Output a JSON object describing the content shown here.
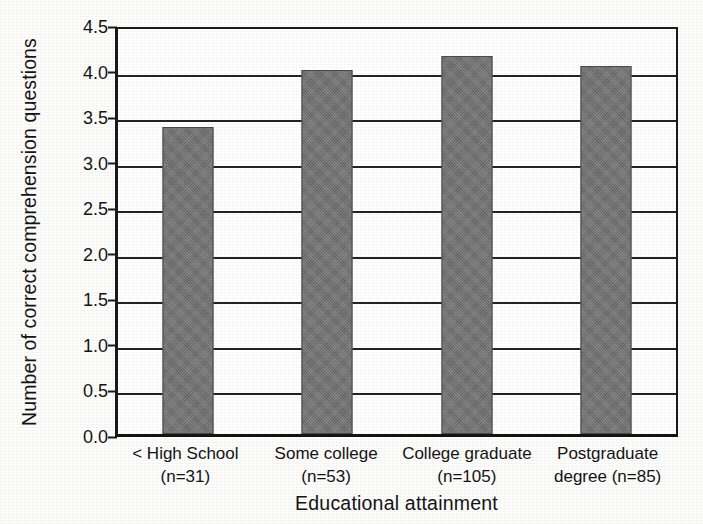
{
  "chart_data": {
    "type": "bar",
    "title": "",
    "xlabel": "Educational attainment",
    "ylabel": "Number of correct comprehension questions",
    "categories": [
      "< High School",
      "Some college",
      "College graduate",
      "Postgraduate degree"
    ],
    "category_labels": [
      {
        "line1": "< High School",
        "line2": "(n=31)"
      },
      {
        "line1": "Some college",
        "line2": "(n=53)"
      },
      {
        "line1": "College graduate",
        "line2": "(n=105)"
      },
      {
        "line1": "Postgraduate",
        "line2": "degree (n=85)"
      }
    ],
    "group_sizes": [
      31,
      53,
      105,
      85
    ],
    "values": [
      3.37,
      4.0,
      4.15,
      4.04
    ],
    "ylim": [
      0.0,
      4.5
    ],
    "ytick_values": [
      0.0,
      0.5,
      1.0,
      1.5,
      2.0,
      2.5,
      3.0,
      3.5,
      4.0,
      4.5
    ],
    "ytick_labels": [
      "0.0",
      "0.5",
      "1.0",
      "1.5",
      "2.0",
      "2.5",
      "3.0",
      "3.5",
      "4.0",
      "4.5"
    ],
    "grid": true,
    "grid_axis": "y",
    "legend": false,
    "bar_color": "#757575",
    "bar_edge_color": "#4a4a4a",
    "axis_color": "#1a1a1a",
    "grid_color": "#232323",
    "background_color": "#ffffff"
  }
}
